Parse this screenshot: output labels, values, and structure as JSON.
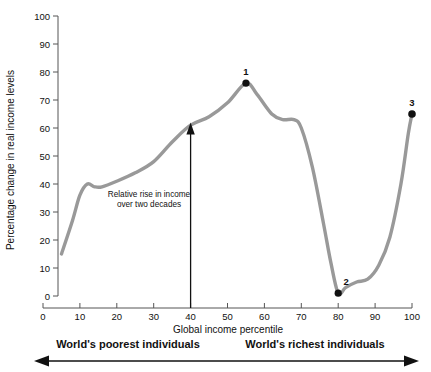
{
  "chart_data": {
    "type": "line",
    "title": "",
    "xlabel": "Global income percentile",
    "ylabel": "Percentage change in real income levels",
    "xlim": [
      0,
      100
    ],
    "ylim": [
      0,
      100
    ],
    "grid": false,
    "legend": "none",
    "x_ticks": [
      "0",
      "10",
      "20",
      "30",
      "40",
      "50",
      "60",
      "70",
      "80",
      "90",
      "100"
    ],
    "y_ticks": [
      "0",
      "10",
      "20",
      "30",
      "40",
      "50",
      "60",
      "70",
      "80",
      "90",
      "100"
    ],
    "series": [
      {
        "name": "Relative rise in real income",
        "color": "#999999",
        "x": [
          5,
          8,
          10,
          12,
          14,
          16,
          20,
          25,
          30,
          35,
          40,
          45,
          50,
          55,
          58,
          62,
          65,
          68,
          70,
          73,
          76,
          78,
          80,
          82,
          85,
          88,
          91,
          94,
          97,
          99,
          100
        ],
        "values": [
          15,
          27,
          36,
          40,
          39,
          39,
          41,
          44,
          48,
          55,
          61,
          64,
          69,
          76,
          72,
          65,
          63,
          63,
          60,
          46,
          26,
          12,
          1,
          3,
          5,
          6,
          11,
          21,
          40,
          58,
          65
        ]
      }
    ],
    "points": [
      {
        "label": "1",
        "x": 55,
        "y": 76
      },
      {
        "label": "2",
        "x": 80,
        "y": 1
      },
      {
        "label": "3",
        "x": 100,
        "y": 65
      }
    ],
    "annotations": [
      {
        "name": "relative-rise-note",
        "text_line1": "Relative rise in income",
        "text_line2": "over two decades",
        "arrow_x": 40,
        "arrow_from_y": 0,
        "arrow_to_y": 62
      }
    ],
    "range_labels": {
      "left": "World's poorest individuals",
      "right": "World's richest individuals"
    }
  },
  "colors": {
    "curve": "#999999",
    "axis": "#555555",
    "marker": "#111111",
    "text": "#111111"
  }
}
